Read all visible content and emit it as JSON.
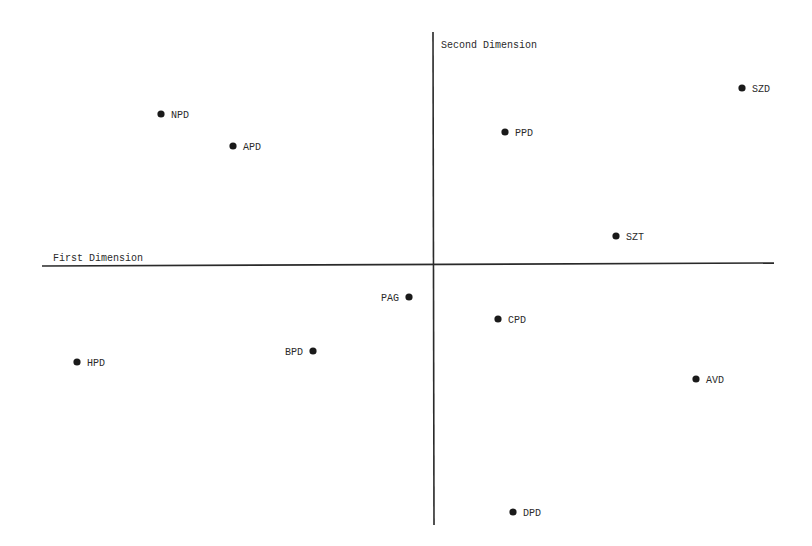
{
  "chart_data": {
    "type": "scatter",
    "title": "",
    "xlabel": "First Dimension",
    "ylabel": "Second Dimension",
    "grid": false,
    "legend": null,
    "axes_note": "Axes cross at the origin. No ticks or numeric scale are shown, so no data coordinates can be read from this figure.",
    "position_units": "pixels (812x546 screenshot)",
    "axis_origin_px": {
      "x": 434,
      "y": 266
    },
    "offset_definition": "dx_px = x_px - 434, dy_px = 266 - y_px (positive dy is up); unscaled pixel offsets, not data values",
    "points": [
      {
        "label": "NPD",
        "x_px": 161,
        "y_px": 114,
        "dx_px": -273,
        "dy_px": 152,
        "label_side": "right"
      },
      {
        "label": "APD",
        "x_px": 233,
        "y_px": 146,
        "dx_px": -201,
        "dy_px": 120,
        "label_side": "right"
      },
      {
        "label": "PPD",
        "x_px": 505,
        "y_px": 132,
        "dx_px": 71,
        "dy_px": 134,
        "label_side": "right"
      },
      {
        "label": "SZD",
        "x_px": 742,
        "y_px": 88,
        "dx_px": 308,
        "dy_px": 178,
        "label_side": "right"
      },
      {
        "label": "SZT",
        "x_px": 616,
        "y_px": 236,
        "dx_px": 182,
        "dy_px": 30,
        "label_side": "right"
      },
      {
        "label": "PAG",
        "x_px": 409,
        "y_px": 297,
        "dx_px": -25,
        "dy_px": -31,
        "label_side": "left"
      },
      {
        "label": "CPD",
        "x_px": 498,
        "y_px": 319,
        "dx_px": 64,
        "dy_px": -53,
        "label_side": "right"
      },
      {
        "label": "BPD",
        "x_px": 313,
        "y_px": 351,
        "dx_px": -121,
        "dy_px": -85,
        "label_side": "left"
      },
      {
        "label": "HPD",
        "x_px": 77,
        "y_px": 362,
        "dx_px": -357,
        "dy_px": -96,
        "label_side": "right"
      },
      {
        "label": "AVD",
        "x_px": 696,
        "y_px": 379,
        "dx_px": 262,
        "dy_px": -113,
        "label_side": "right"
      },
      {
        "label": "DPD",
        "x_px": 513,
        "y_px": 512,
        "dx_px": 79,
        "dy_px": -246,
        "label_side": "right"
      }
    ]
  },
  "layout": {
    "x_axis": {
      "x1": 42,
      "y1": 266,
      "x2": 774,
      "y2": 263
    },
    "y_axis": {
      "x1": 433,
      "y1": 32,
      "x2": 434,
      "y2": 525
    },
    "x_axis_label_pos": {
      "x": 53,
      "y": 261
    },
    "y_axis_label_pos": {
      "x": 441,
      "y": 48
    },
    "colors": {
      "background": "#ffffff",
      "ink": "#1a1a1a"
    }
  }
}
